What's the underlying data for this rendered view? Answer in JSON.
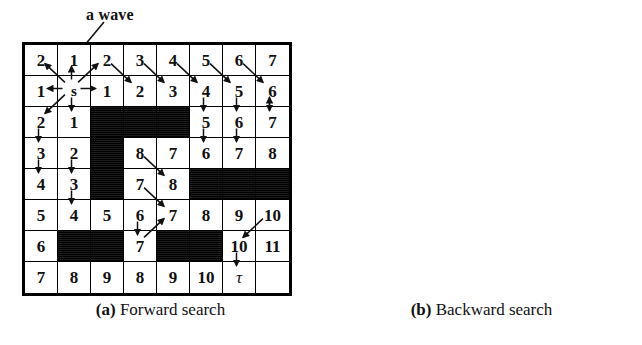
{
  "figure": {
    "panels": [
      {
        "id": "forward",
        "caption_tag": "(a)",
        "caption_text": "Forward search",
        "annotation": "a wave",
        "show_axis_labels": false
      },
      {
        "id": "backward",
        "caption_tag": "(b)",
        "caption_text": "Backward search",
        "annotation": "",
        "show_axis_labels": true
      }
    ],
    "axes": {
      "col_labels": [
        "1",
        "2",
        "3",
        "4",
        "5",
        "6",
        "7",
        "8"
      ],
      "row_labels": [
        "8",
        "7",
        "6",
        "5",
        "4",
        "3",
        "2",
        "1"
      ]
    },
    "symbols": {
      "start": "s",
      "goal": "τ"
    },
    "colors": {
      "grid_line": "#000000",
      "obstacle": "#0a0a0a",
      "cell_bg": "#ffffff",
      "text": "#111111"
    }
  },
  "chart_data": {
    "type": "heatmap",
    "xlabel": "",
    "ylabel": "",
    "categories": [
      "1",
      "2",
      "3",
      "4",
      "5",
      "6",
      "7",
      "8"
    ],
    "row_categories": [
      "8",
      "7",
      "6",
      "5",
      "4",
      "3",
      "2",
      "1"
    ],
    "legend": [
      "(a) Forward search",
      "(b) Backward search"
    ],
    "grid_rows": [
      [
        "2",
        "1",
        "2",
        "3",
        "4",
        "5",
        "6",
        "7"
      ],
      [
        "1",
        "s",
        "1",
        "2",
        "3",
        "4",
        "5",
        "6"
      ],
      [
        "2",
        "1",
        "#",
        "#",
        "#",
        "5",
        "6",
        "7"
      ],
      [
        "3",
        "2",
        "#",
        "8",
        "7",
        "6",
        "7",
        "8"
      ],
      [
        "4",
        "3",
        "#",
        "7",
        "8",
        "#",
        "#",
        "#"
      ],
      [
        "5",
        "4",
        "5",
        "6",
        "7",
        "8",
        "9",
        "10"
      ],
      [
        "6",
        "#",
        "#",
        "7",
        "#",
        "#",
        "10",
        "11"
      ],
      [
        "7",
        "8",
        "9",
        "8",
        "9",
        "10",
        "τ",
        ""
      ]
    ],
    "start_cell": {
      "row": 1,
      "col": 1
    },
    "goal_cell": {
      "row": 7,
      "col": 6
    },
    "obstacles": [
      {
        "row": 2,
        "col": 2
      },
      {
        "row": 2,
        "col": 3
      },
      {
        "row": 2,
        "col": 4
      },
      {
        "row": 3,
        "col": 2
      },
      {
        "row": 4,
        "col": 2
      },
      {
        "row": 4,
        "col": 5
      },
      {
        "row": 4,
        "col": 6
      },
      {
        "row": 4,
        "col": 7
      },
      {
        "row": 6,
        "col": 1
      },
      {
        "row": 6,
        "col": 2
      },
      {
        "row": 6,
        "col": 4
      },
      {
        "row": 6,
        "col": 5
      }
    ],
    "empty_cells": [
      {
        "row": 7,
        "col": 7
      }
    ],
    "forward_path_arrows": [
      {
        "from": [
          1,
          1
        ],
        "to": [
          0,
          0
        ]
      },
      {
        "from": [
          1,
          1
        ],
        "to": [
          0,
          1
        ]
      },
      {
        "from": [
          1,
          1
        ],
        "to": [
          0,
          2
        ]
      },
      {
        "from": [
          1,
          1
        ],
        "to": [
          1,
          0
        ]
      },
      {
        "from": [
          1,
          1
        ],
        "to": [
          1,
          2
        ]
      },
      {
        "from": [
          1,
          1
        ],
        "to": [
          2,
          0
        ]
      },
      {
        "from": [
          1,
          1
        ],
        "to": [
          2,
          1
        ]
      },
      {
        "from": [
          0,
          2
        ],
        "to": [
          1,
          3
        ]
      },
      {
        "from": [
          0,
          3
        ],
        "to": [
          1,
          4
        ]
      },
      {
        "from": [
          0,
          4
        ],
        "to": [
          1,
          5
        ]
      },
      {
        "from": [
          0,
          5
        ],
        "to": [
          1,
          6
        ]
      },
      {
        "from": [
          0,
          6
        ],
        "to": [
          1,
          7
        ]
      },
      {
        "from": [
          1,
          5
        ],
        "to": [
          2,
          5
        ]
      },
      {
        "from": [
          1,
          6
        ],
        "to": [
          2,
          6
        ]
      },
      {
        "from": [
          1,
          7
        ],
        "to": [
          2,
          7
        ]
      },
      {
        "from": [
          2,
          5
        ],
        "to": [
          3,
          5
        ]
      },
      {
        "from": [
          2,
          6
        ],
        "to": [
          3,
          6
        ]
      },
      {
        "from": [
          2,
          0
        ],
        "to": [
          3,
          0
        ]
      },
      {
        "from": [
          3,
          0
        ],
        "to": [
          4,
          0
        ]
      },
      {
        "from": [
          3,
          1
        ],
        "to": [
          4,
          1
        ]
      },
      {
        "from": [
          4,
          1
        ],
        "to": [
          5,
          1
        ]
      },
      {
        "from": [
          3,
          3
        ],
        "to": [
          4,
          4
        ]
      },
      {
        "from": [
          4,
          3
        ],
        "to": [
          5,
          4
        ]
      },
      {
        "from": [
          5,
          3
        ],
        "to": [
          6,
          3
        ]
      },
      {
        "from": [
          6,
          3
        ],
        "to": [
          5,
          4
        ]
      },
      {
        "from": [
          5,
          7
        ],
        "to": [
          6,
          6
        ]
      },
      {
        "from": [
          6,
          6
        ],
        "to": [
          7,
          6
        ]
      },
      {
        "from": [
          2,
          7
        ],
        "to": [
          1,
          7
        ]
      }
    ],
    "backward_path_links": [
      {
        "from": [
          1,
          1
        ],
        "to": [
          2,
          1
        ],
        "dir": "v"
      },
      {
        "from": [
          2,
          1
        ],
        "to": [
          3,
          1
        ],
        "dir": "v"
      },
      {
        "from": [
          3,
          1
        ],
        "to": [
          4,
          1
        ],
        "dir": "v"
      },
      {
        "from": [
          4,
          1
        ],
        "to": [
          5,
          1
        ],
        "dir": "v"
      },
      {
        "from": [
          5,
          1
        ],
        "to": [
          5,
          2
        ],
        "dir": "h"
      },
      {
        "from": [
          5,
          2
        ],
        "to": [
          5,
          3
        ],
        "dir": "h"
      },
      {
        "from": [
          5,
          3
        ],
        "to": [
          5,
          4
        ],
        "dir": "h"
      },
      {
        "from": [
          5,
          4
        ],
        "to": [
          5,
          5
        ],
        "dir": "h"
      },
      {
        "from": [
          5,
          5
        ],
        "to": [
          5,
          6
        ],
        "dir": "h"
      },
      {
        "from": [
          5,
          3
        ],
        "to": [
          6,
          3
        ],
        "dir": "v"
      },
      {
        "from": [
          6,
          3
        ],
        "to": [
          7,
          3
        ],
        "dir": "v"
      },
      {
        "from": [
          7,
          3
        ],
        "to": [
          7,
          4
        ],
        "dir": "h"
      },
      {
        "from": [
          7,
          4
        ],
        "to": [
          7,
          5
        ],
        "dir": "h"
      },
      {
        "from": [
          7,
          5
        ],
        "to": [
          7,
          6
        ],
        "dir": "h"
      },
      {
        "from": [
          5,
          6
        ],
        "to": [
          6,
          6
        ],
        "dir": "v"
      },
      {
        "from": [
          6,
          6
        ],
        "to": [
          7,
          6
        ],
        "dir": "v"
      }
    ]
  }
}
